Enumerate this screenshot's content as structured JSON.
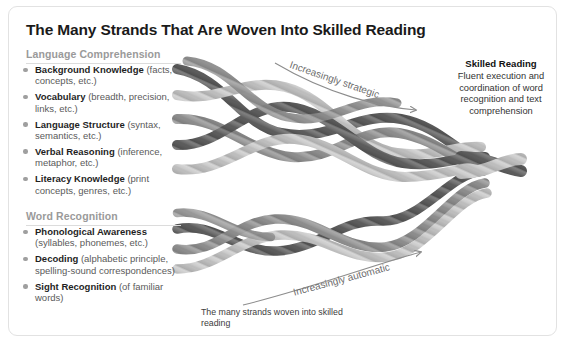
{
  "title": "The Many Strands That Are Woven Into Skilled Reading",
  "sections": {
    "language_comprehension": {
      "heading": "Language Comprehension",
      "items": [
        {
          "name": "Background Knowledge",
          "detail": "(facts, concepts, etc.)"
        },
        {
          "name": "Vocabulary",
          "detail": "(breadth, precision, links, etc.)"
        },
        {
          "name": "Language Structure",
          "detail": "(syntax, semantics, etc.)"
        },
        {
          "name": "Verbal Reasoning",
          "detail": "(inference, metaphor, etc.)"
        },
        {
          "name": "Literacy Knowledge",
          "detail": "(print concepts, genres, etc.)"
        }
      ]
    },
    "word_recognition": {
      "heading": "Word Recognition",
      "items": [
        {
          "name": "Phonological Awareness",
          "detail": "(syllables, phonemes, etc.)"
        },
        {
          "name": "Decoding",
          "detail": "(alphabetic principle, spelling-sound correspondences)"
        },
        {
          "name": "Sight Recognition",
          "detail": "(of familiar words)"
        }
      ]
    }
  },
  "skilled_reading": {
    "title": "Skilled Reading",
    "description": "Fluent execution and coordination of word recognition and text comprehension"
  },
  "arrows": {
    "upper_label": "Increasingly strategic",
    "lower_label": "Increasingly automatic"
  },
  "bottom_caption": "The many strands woven into skilled reading",
  "colors": {
    "frame_border": "#e2e2e2",
    "title_text": "#1a1a1a",
    "section_heading": "#9a9a9a",
    "bullet": "#9f9f9f",
    "strand_name": "#1f1f1f",
    "strand_detail": "#5a5a5a",
    "arrow_label": "#6c6c6c",
    "rope_dark": "#6e6e6e",
    "rope_mid": "#9b9b9b",
    "rope_light": "#c9c9c9"
  }
}
